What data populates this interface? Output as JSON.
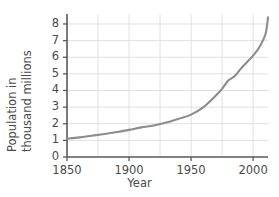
{
  "chart_data": {
    "type": "line",
    "title": "",
    "xlabel": "Year",
    "ylabel": "Population in thousand millions",
    "ylabel_lines": [
      "Population in",
      "thousand millions"
    ],
    "xlim": [
      1850,
      2012
    ],
    "ylim": [
      0,
      8.6
    ],
    "xticks": [
      1850,
      1900,
      1950,
      2000
    ],
    "xtick_labels": [
      "1850",
      "1900",
      "1950",
      "2000"
    ],
    "yticks": [
      0,
      1,
      2,
      3,
      4,
      5,
      6,
      7,
      8
    ],
    "ytick_labels": [
      "0",
      "1",
      "2",
      "3",
      "4",
      "5",
      "6",
      "7",
      "8"
    ],
    "grid": true,
    "grid_x_values": [
      1875,
      1900,
      1925,
      1950,
      1975,
      2000
    ],
    "grid_y_values": [
      1,
      2,
      3,
      4,
      5,
      6,
      7,
      8
    ],
    "legend": "none",
    "series": [
      {
        "name": "World population",
        "x": [
          1850,
          1860,
          1870,
          1880,
          1890,
          1900,
          1910,
          1920,
          1930,
          1940,
          1950,
          1960,
          1970,
          1975,
          1980,
          1985,
          1990,
          1995,
          2000,
          2005,
          2010,
          2012
        ],
        "values": [
          1.1,
          1.18,
          1.28,
          1.38,
          1.5,
          1.63,
          1.78,
          1.9,
          2.07,
          2.3,
          2.55,
          3.0,
          3.7,
          4.1,
          4.6,
          4.85,
          5.3,
          5.7,
          6.1,
          6.6,
          7.4,
          8.4
        ]
      }
    ],
    "colors": {
      "line": "#8c8c8c",
      "axis": "#595959",
      "grid": "#e0e0e0",
      "text": "#4a4a4a",
      "background": "#ffffff"
    }
  }
}
